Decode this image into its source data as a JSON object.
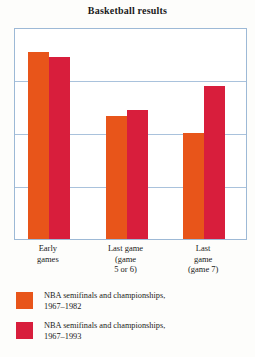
{
  "chart_data": {
    "type": "bar",
    "title": "Basketball results",
    "xlabel": "",
    "ylabel": "",
    "ylim": [
      0,
      100
    ],
    "grid": true,
    "gridlines": [
      0,
      25,
      50,
      75,
      100
    ],
    "legend_position": "below",
    "categories": [
      "Early\ngames",
      "Last game\n(game\n5 or 6)",
      "Last\ngame\n(game 7)"
    ],
    "series": [
      {
        "name": "NBA semifinals and championships,\n1967–1982",
        "color": "#e8551a",
        "values": [
          88,
          58,
          50
        ]
      },
      {
        "name": "NBA semifinals and championships,\n1967–1993",
        "color": "#d81e3c",
        "values": [
          86,
          61,
          72
        ]
      }
    ]
  },
  "legend": {
    "items": [
      {
        "label": "NBA semifinals and championships,\n1967–1982",
        "color": "#e8551a"
      },
      {
        "label": "NBA semifinals and championships,\n1967–1993",
        "color": "#d81e3c"
      }
    ]
  },
  "colors": {
    "series_a": "#e8551a",
    "series_b": "#d81e3c",
    "grid": "#a9c2dc",
    "frame": "#9db9d6",
    "text": "#1a1a1a",
    "background": "#fdfdfb"
  }
}
